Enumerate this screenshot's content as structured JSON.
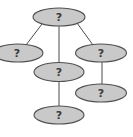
{
  "diagram": {
    "type": "tree",
    "colors": {
      "node_fill": "#c9c9c9",
      "node_stroke": "#505050",
      "edge": "#4a4a4a",
      "label": "#3a3a3a",
      "background": "#ffffff"
    },
    "nodes": [
      {
        "id": "root",
        "label": "?",
        "cx": 59,
        "cy": 17,
        "rx": 26,
        "ry": 9
      },
      {
        "id": "left",
        "label": "?",
        "cx": 18,
        "cy": 53,
        "rx": 25,
        "ry": 9
      },
      {
        "id": "middle",
        "label": "?",
        "cx": 59,
        "cy": 72,
        "rx": 25,
        "ry": 9
      },
      {
        "id": "right",
        "label": "?",
        "cx": 101,
        "cy": 53,
        "rx": 25,
        "ry": 9
      },
      {
        "id": "right-child",
        "label": "?",
        "cx": 101,
        "cy": 93,
        "rx": 25,
        "ry": 9
      },
      {
        "id": "bottom",
        "label": "?",
        "cx": 59,
        "cy": 115,
        "rx": 25,
        "ry": 9
      }
    ],
    "edges": [
      {
        "from": "root",
        "to": "left"
      },
      {
        "from": "root",
        "to": "middle"
      },
      {
        "from": "root",
        "to": "right"
      },
      {
        "from": "right",
        "to": "right-child"
      },
      {
        "from": "middle",
        "to": "bottom"
      }
    ]
  }
}
